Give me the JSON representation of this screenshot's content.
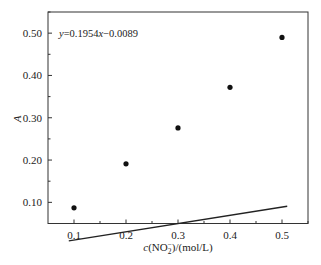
{
  "chart_data": {
    "type": "scatter",
    "title": "",
    "xlabel": "c(NO2-)/(mol/L)",
    "xlabel_parts": {
      "c": "c",
      "open": "(NO",
      "sub": "2",
      "sup": "−",
      "close": ")/(mol/L)"
    },
    "ylabel": "A",
    "xlim": [
      0.05,
      0.55
    ],
    "ylim": [
      0.05,
      0.55
    ],
    "xticks": [
      0.1,
      0.2,
      0.3,
      0.4,
      0.5
    ],
    "xtick_labels": [
      "0.1",
      "0.2",
      "0.3",
      "0.4",
      "0.5"
    ],
    "yticks": [
      0.1,
      0.2,
      0.3,
      0.4,
      0.5
    ],
    "ytick_labels": [
      "0.10",
      "0.20",
      "0.30",
      "0.40",
      "0.50"
    ],
    "grid": false,
    "legend": null,
    "series": [
      {
        "name": "measured",
        "marker": "filled-circle",
        "x": [
          0.1,
          0.2,
          0.3,
          0.4,
          0.5
        ],
        "y": [
          0.087,
          0.191,
          0.276,
          0.372,
          0.49
        ]
      },
      {
        "name": "linear fit",
        "type": "line",
        "slope": 0.1954,
        "intercept": -0.0089,
        "x_range": [
          0.09,
          0.51
        ]
      }
    ],
    "annotations": [
      {
        "text": "y=0.1954x−0.0089",
        "position": "top-left"
      }
    ]
  },
  "annotation": {
    "y": "y",
    "eq_mid": "=0.1954",
    "x": "x",
    "eq_end": "−0.0089"
  }
}
